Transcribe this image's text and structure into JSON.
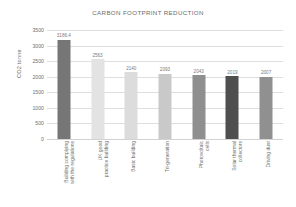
{
  "chart_data": {
    "type": "bar",
    "title": "CARBON FOOTPRINT REDUCTION",
    "xlabel": "",
    "ylabel": "CO2 tonne",
    "ylim": [
      0,
      3500
    ],
    "yticks": [
      0,
      500,
      1000,
      1500,
      2000,
      2500,
      3000,
      3500
    ],
    "grid": true,
    "legend": "none",
    "categories": [
      "Building complying with the regulations",
      "UK good practice building",
      "Basic building",
      "Tri-generation",
      "Photovoltaic cells",
      "Solar thermal collectors",
      "Driving dust"
    ],
    "values": [
      3186.4,
      2563,
      2140,
      2093,
      2043,
      2019,
      2007
    ],
    "value_labels": [
      "3186.4",
      "2563",
      "2140",
      "2093",
      "2043",
      "2019",
      "2007"
    ],
    "bar_colors": [
      "#767676",
      "#e3e3e3",
      "#dcdcdc",
      "#c9c9c9",
      "#8f8f8f",
      "#4f4f4f",
      "#909090"
    ],
    "series": [
      {
        "name": "CO2 tonne",
        "values": [
          3186.4,
          2563,
          2140,
          2093,
          2043,
          2019,
          2007
        ]
      }
    ]
  },
  "axis": {
    "tick_labels": [
      "3500",
      "3000",
      "2500",
      "2000",
      "1500",
      "1000",
      "500",
      "0"
    ],
    "y_title": "CO2 tonne"
  },
  "category_lines": [
    [
      "Building complying",
      "with the regulations"
    ],
    [
      "UK good",
      "practice building"
    ],
    [
      "Basic building",
      ""
    ],
    [
      "Tri-generation",
      ""
    ],
    [
      "Photovoltaic",
      "cells"
    ],
    [
      "Solar thermal",
      "collectors"
    ],
    [
      "Driving dust",
      ""
    ]
  ],
  "style": {
    "background": "#ffffff",
    "gridline_color": "#dedede",
    "text_color": "#6b6b6b"
  }
}
